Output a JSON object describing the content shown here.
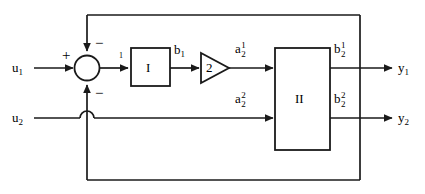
{
  "figure": {
    "type": "block-diagram",
    "stroke_color": "#1a1a1a",
    "background_color": "#ffffff"
  },
  "inputs": [
    {
      "id": "u1",
      "base": "u",
      "subscript": "1",
      "label": "u1"
    },
    {
      "id": "u2",
      "base": "u",
      "subscript": "2",
      "label": "u2"
    }
  ],
  "outputs": [
    {
      "id": "y1",
      "base": "y",
      "subscript": "1",
      "label": "y1"
    },
    {
      "id": "y2",
      "base": "y",
      "subscript": "2",
      "label": "y2"
    }
  ],
  "summing_junction": {
    "name": "summing-junction",
    "signs": {
      "left": "+",
      "top": "−",
      "bottom": "−"
    }
  },
  "blocks": [
    {
      "id": "block-1",
      "label": "I",
      "shape": "rectangle"
    },
    {
      "id": "gain",
      "label": "2",
      "shape": "triangle"
    },
    {
      "id": "block-2",
      "label": "II",
      "shape": "rectangle"
    }
  ],
  "signals": [
    {
      "id": "e1",
      "base": "1",
      "note": "summer output into block I"
    },
    {
      "id": "b1",
      "base": "b",
      "subscript": "1",
      "label": "b1"
    },
    {
      "id": "a2_1",
      "base": "a",
      "subscript": "2",
      "superscript": "1",
      "label": "a2^1"
    },
    {
      "id": "a2_2",
      "base": "a",
      "subscript": "2",
      "superscript": "2",
      "label": "a2^2"
    },
    {
      "id": "b2_1",
      "base": "b",
      "subscript": "2",
      "superscript": "1",
      "label": "b2^1"
    },
    {
      "id": "b2_2",
      "base": "b",
      "subscript": "2",
      "superscript": "2",
      "label": "b2^2"
    }
  ],
  "wires": {
    "feedback_top": "from output bus up and left into summing junction top (negative)",
    "feedback_bottom": "from output bus down and left into summing junction bottom (negative)",
    "crossing_hop": "u2 line hops over the vertical feedback line"
  }
}
